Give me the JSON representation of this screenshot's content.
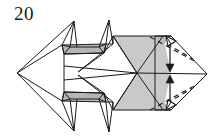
{
  "figure": {
    "step_number": "20",
    "type": "origami-folding-diagram",
    "caption": "",
    "background_color": "#ffffff",
    "ink_color": "#1a1a1a",
    "shaded_color": "#c9c9c9",
    "shaded_color_dark": "#b5b5b5",
    "canvas": {
      "width": 221,
      "height": 140
    }
  },
  "geometry": {
    "left_vertex": [
      17,
      73
    ],
    "right_vertex": [
      207,
      74
    ],
    "center_axis_y": 73,
    "body_top_y": 36,
    "body_bottom_y": 110,
    "spike_top_y": 21,
    "spike_bottom_y": 131
  },
  "annotations": {
    "arrows": [
      {
        "name": "fold-arrow-top",
        "label": "",
        "direction": "down",
        "style": "double-headed-hollow",
        "from": [
          171,
          40
        ],
        "to": [
          170,
          70
        ]
      },
      {
        "name": "fold-arrow-bottom",
        "label": "",
        "direction": "up",
        "style": "double-headed-hollow",
        "from": [
          170,
          107
        ],
        "to": [
          171,
          77
        ]
      }
    ],
    "fold_lines": [
      {
        "name": "valley-fold-upper",
        "style": "dashed",
        "from": [
          150,
          37
        ],
        "to": [
          196,
          62
        ]
      },
      {
        "name": "valley-fold-lower",
        "style": "dashed",
        "from": [
          150,
          110
        ],
        "to": [
          196,
          85
        ]
      },
      {
        "name": "valley-fold-upper-inner",
        "style": "dashed",
        "from": [
          161,
          44
        ],
        "to": [
          190,
          60
        ]
      },
      {
        "name": "valley-fold-lower-inner",
        "style": "dashed",
        "from": [
          161,
          103
        ],
        "to": [
          190,
          87
        ]
      }
    ]
  },
  "shaded_regions": [
    {
      "name": "upper-bowtie-panel",
      "color": "#c9c9c9"
    },
    {
      "name": "lower-bowtie-panel",
      "color": "#c9c9c9"
    },
    {
      "name": "upper-band-panel",
      "color": "#b5b5b5"
    },
    {
      "name": "lower-band-panel",
      "color": "#b5b5b5"
    },
    {
      "name": "right-corner-upper",
      "color": "#c9c9c9"
    },
    {
      "name": "right-corner-lower",
      "color": "#c9c9c9"
    }
  ]
}
